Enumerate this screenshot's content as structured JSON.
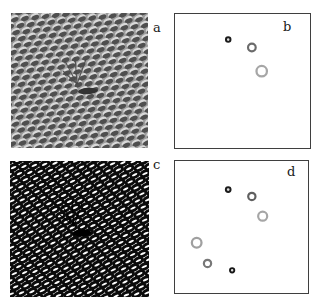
{
  "figure": {
    "background": "#ffffff",
    "panels": {
      "a": {
        "label": "a",
        "type": "texture-emboss",
        "x": 11,
        "y": 13,
        "w": 137,
        "h": 135,
        "bg": "#9c9c9c",
        "blob_dark": "#4f4f4f",
        "blob_light": "#d9d9d9",
        "cell_dx": 10.3,
        "cell_dy": 6.5,
        "rx": 4.3,
        "ry": 2.5,
        "tilt": -18,
        "lattice_rotate": -6,
        "defect": {
          "streak": {
            "x": 77,
            "y": 78,
            "rx": 10,
            "ry": 3.2,
            "rot": -4,
            "color": "#333333"
          },
          "rays": [
            [
              66,
              71,
              54,
              48
            ],
            [
              66,
              71,
              64,
              44
            ],
            [
              66,
              71,
              75,
              46
            ],
            [
              66,
              71,
              52,
              58
            ]
          ],
          "ray_color": "#4a4a4a"
        }
      },
      "b": {
        "label": "b",
        "type": "markers",
        "x": 174,
        "y": 13,
        "w": 137,
        "h": 136,
        "border": "#3f3f3f",
        "bg": "#ffffff",
        "circles": [
          {
            "kind": "small-dark-ring",
            "cx": 54,
            "cy": 26,
            "r": 2.3,
            "sw": 2.0,
            "stroke": "#1c1c1c",
            "fill": "#dddddd"
          },
          {
            "kind": "medium-gray-ring",
            "cx": 78,
            "cy": 34,
            "r": 3.9,
            "sw": 2.2,
            "stroke": "#6b6b6b",
            "fill": "#ffffff"
          },
          {
            "kind": "large-light-ring",
            "cx": 88,
            "cy": 58,
            "r": 5.3,
            "sw": 2.3,
            "stroke": "#a6a6a6",
            "fill": "#ffffff"
          }
        ]
      },
      "c": {
        "label": "c",
        "type": "texture-rings",
        "x": 10,
        "y": 161,
        "w": 139,
        "h": 136,
        "bg": "#ffffff",
        "ring_color": "#0b0b0b",
        "ring_stroke": 2.9,
        "cell_dx": 10.4,
        "cell_dy": 6.6,
        "rx": 4.4,
        "ry": 2.5,
        "tilt": -18,
        "lattice_rotate": -6,
        "defect": {
          "streak": {
            "x": 72,
            "y": 72,
            "rx": 9.5,
            "ry": 3.4,
            "rot": -4,
            "color": "#000000"
          },
          "rays": [
            [
              64,
              65,
              52,
              44
            ],
            [
              64,
              65,
              62,
              40
            ],
            [
              64,
              65,
              72,
              42
            ],
            [
              64,
              65,
              50,
              54
            ]
          ],
          "ray_color": "#000000"
        }
      },
      "d": {
        "label": "d",
        "type": "markers",
        "x": 174,
        "y": 160,
        "w": 135,
        "h": 134,
        "border": "#3f3f3f",
        "bg": "#ffffff",
        "circles": [
          {
            "kind": "small-dark-ring",
            "cx": 54,
            "cy": 29,
            "r": 2.4,
            "sw": 2.0,
            "stroke": "#1c1c1c",
            "fill": "#dddddd"
          },
          {
            "kind": "medium-gray-ring",
            "cx": 78,
            "cy": 36,
            "r": 3.7,
            "sw": 2.2,
            "stroke": "#606060",
            "fill": "#ffffff"
          },
          {
            "kind": "large-light-ring",
            "cx": 89,
            "cy": 56,
            "r": 4.6,
            "sw": 2.2,
            "stroke": "#a6a6a6",
            "fill": "#ffffff"
          },
          {
            "kind": "large-light-ring",
            "cx": 22,
            "cy": 83,
            "r": 4.9,
            "sw": 2.3,
            "stroke": "#a0a0a0",
            "fill": "#ffffff"
          },
          {
            "kind": "medium-gray-ring",
            "cx": 33,
            "cy": 104,
            "r": 3.7,
            "sw": 2.2,
            "stroke": "#787878",
            "fill": "#ffffff"
          },
          {
            "kind": "small-dark-ring",
            "cx": 58,
            "cy": 111,
            "r": 2.2,
            "sw": 1.9,
            "stroke": "#161616",
            "fill": "#dddddd"
          }
        ]
      }
    }
  }
}
